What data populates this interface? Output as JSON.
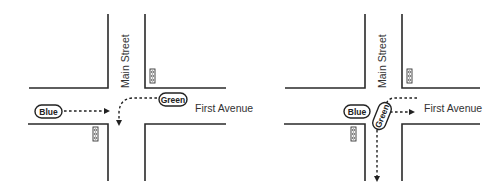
{
  "diagram": {
    "panels": [
      {
        "id": "left",
        "street_vertical": "Main Street",
        "street_horizontal": "First Avenue",
        "cars": [
          {
            "label": "Blue",
            "direction": "straight east"
          },
          {
            "label": "Green",
            "direction": "left turn south"
          }
        ],
        "traffic_lights": 2
      },
      {
        "id": "right",
        "street_vertical": "Main Street",
        "street_horizontal": "First Avenue",
        "cars": [
          {
            "label": "Blue",
            "direction": "stopped at intersection"
          },
          {
            "label": "Green",
            "direction": "turning, paths east and south"
          }
        ],
        "traffic_lights": 2
      }
    ],
    "colors": {
      "line": "#2a2a2a",
      "background": "#ffffff"
    }
  }
}
